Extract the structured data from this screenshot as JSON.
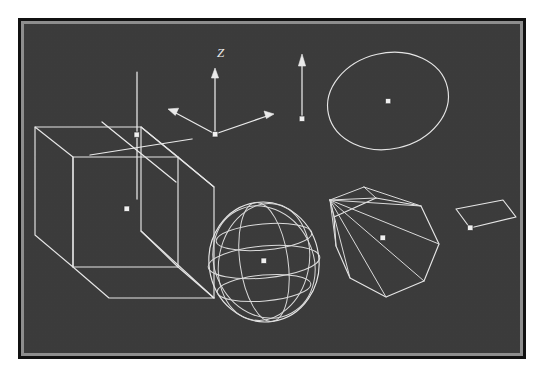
{
  "app": {
    "title": "3D Wireframe Viewport",
    "background_color": "#3b3b3b",
    "wire_color": "#e8e8e8",
    "frame_outer_color": "#111111",
    "frame_bevel_color": "#8d8d8d",
    "marker_color": "#f2f2f2"
  },
  "clipped_header": {
    "text": ""
  },
  "viewport": {
    "label": "wireframe-scene",
    "width_px": 508,
    "height_px": 341
  },
  "axis_gizmo": {
    "name": "coordinate-axis-gizmo",
    "z_label": "Z",
    "origin_label": "origin-point",
    "arrow_count": 3
  },
  "objects": [
    {
      "id": "obj-1",
      "name": "axis-cross",
      "type": "three-axis-cross",
      "label": "3-Axis Cross",
      "center": {
        "x": 125,
        "y": 128
      },
      "has_center_marker": true
    },
    {
      "id": "obj-2",
      "name": "coordinate-gizmo",
      "type": "axis-triad",
      "label": "Coordinate Triad",
      "center": {
        "x": 208,
        "y": 122
      },
      "has_center_marker": true
    },
    {
      "id": "obj-3",
      "name": "vector-arrow",
      "type": "vector",
      "label": "Vector Arrow",
      "center": {
        "x": 294,
        "y": 110
      },
      "has_center_marker": true
    },
    {
      "id": "obj-4",
      "name": "circle-ellipse",
      "type": "circle",
      "label": "Circle",
      "center": {
        "x": 382,
        "y": 94
      },
      "has_center_marker": true
    },
    {
      "id": "obj-5",
      "name": "wireframe-cube",
      "type": "box",
      "label": "Box",
      "center": {
        "x": 125,
        "y": 268
      },
      "has_center_marker": true
    },
    {
      "id": "obj-6",
      "name": "wireframe-sphere",
      "type": "sphere",
      "label": "Sphere",
      "center": {
        "x": 249,
        "y": 245
      },
      "has_center_marker": true
    },
    {
      "id": "obj-7",
      "name": "wireframe-cone",
      "type": "cone",
      "label": "Cone",
      "center": {
        "x": 380,
        "y": 222
      },
      "has_center_marker": true
    },
    {
      "id": "obj-8",
      "name": "wireframe-plane",
      "type": "plane",
      "label": "Plane",
      "center": {
        "x": 462,
        "y": 205
      },
      "has_center_marker": true
    }
  ]
}
